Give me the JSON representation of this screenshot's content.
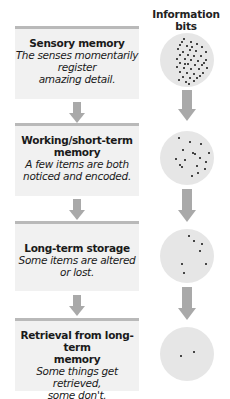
{
  "header": {
    "title": "Information bits"
  },
  "stages": [
    {
      "title": "Sensory memory",
      "desc_lines": [
        "The senses momentarily",
        "register",
        "amazing detail."
      ]
    },
    {
      "title_lines": [
        "Working/short-term",
        "memory"
      ],
      "desc_lines": [
        "A few items are both",
        "noticed and encoded."
      ]
    },
    {
      "title": "Long-term storage",
      "desc_lines": [
        "Some items are altered",
        "or lost."
      ]
    },
    {
      "title_lines": [
        "Retrieval from long-term",
        "memory"
      ],
      "desc_lines": [
        "Some things get",
        "retrieved,",
        "some don't."
      ]
    }
  ],
  "circles": [
    {
      "label": "many-bits",
      "dot_count": 45
    },
    {
      "label": "few-bits",
      "dot_count": 17
    },
    {
      "label": "fewer-bits",
      "dot_count": 5
    },
    {
      "label": "retrieved-bits",
      "dot_count": 2
    }
  ],
  "colors": {
    "box_bg": "#f1f1f1",
    "box_border": "#b9b9b9",
    "arrow": "#a9a9a9",
    "circle": "#e6e6e6",
    "dot": "#111111"
  }
}
